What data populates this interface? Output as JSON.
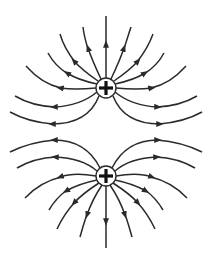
{
  "diagram": {
    "title": "Electric field lines of two positive charges",
    "colors": {
      "line": "#2a2a2a",
      "background": "#ffffff",
      "sign": "#111111"
    },
    "charges": [
      {
        "id": "upper",
        "sign": "+",
        "cx": 106,
        "cy": 88,
        "r": 10
      },
      {
        "id": "lower",
        "sign": "+",
        "cx": 106,
        "cy": 176,
        "r": 10
      }
    ],
    "line_direction": "outward from charges"
  }
}
